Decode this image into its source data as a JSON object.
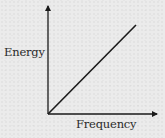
{
  "chart_data": {
    "type": "line",
    "title": "",
    "xlabel": "Frequency",
    "ylabel": "Energy",
    "x_ticks": [],
    "y_ticks": [],
    "grid": false,
    "legend": null,
    "axes": {
      "style": "arrows",
      "origin": [
        0,
        0
      ]
    },
    "series": [
      {
        "name": "Energy vs Frequency",
        "description": "Straight line through the origin with positive slope (E = h·f)",
        "x": [
          0,
          1
        ],
        "y": [
          0,
          1
        ],
        "color": "#1a1a1a"
      }
    ],
    "xlim": [
      0,
      1.2
    ],
    "ylim": [
      0,
      1.2
    ]
  },
  "colors": {
    "background": "#ebebeb",
    "axis": "#1a1a1a",
    "line": "#1a1a1a",
    "text": "#2a2a2a"
  }
}
